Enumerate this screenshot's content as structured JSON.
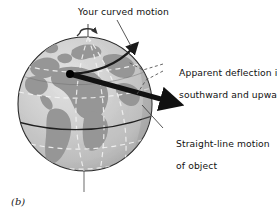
{
  "figure": {
    "caption": "(b)",
    "background_color": "#ffffff",
    "width": 277,
    "height": 220
  },
  "labels": {
    "curved_motion": "Your curved motion",
    "apparent_deflection_line1": "Apparent deflection is",
    "apparent_deflection_line2": "southward and upward",
    "straight_line_line1": "Straight-line motion",
    "straight_line_line2": "of object"
  },
  "globe": {
    "name": "earth-globe",
    "center_x": 85,
    "center_y": 104,
    "radius": 67,
    "ocean_color": "#c9c9c9",
    "land_color": "#969696",
    "outline_color": "#2b2b2b",
    "highlight_color": "#e2e2e2",
    "shadow_color": "#8f8f8f",
    "gridline_color": "#f2f2f2",
    "equator_color": "#1f1f1f",
    "axis_color": "#555555"
  },
  "annotations": {
    "origin_dot": {
      "name": "launch-point-dot",
      "x": 70,
      "y": 74,
      "radius": 4,
      "color": "#000000"
    },
    "straight_arrow": {
      "name": "straight-line-motion-arrow",
      "from_x": 70,
      "from_y": 74,
      "to_x": 174,
      "to_y": 103,
      "color": "#111111",
      "thickness": 5
    },
    "curved_arrow": {
      "name": "curved-motion-arrow",
      "from_x": 70,
      "from_y": 74,
      "to_x": 140,
      "to_y": 44,
      "color": "#1a1a1a",
      "thickness": 2.4
    },
    "rotation_arrow": {
      "name": "earth-rotation-arrow",
      "x": 88,
      "y": 31,
      "color": "#333333"
    },
    "deflection_dashes": {
      "name": "deflection-dashed-lines",
      "color": "#555555"
    },
    "leader_lines": {
      "name": "label-leader-lines",
      "color": "#444444"
    }
  },
  "icons": {
    "rotation": "curved-rotation-arrow-icon",
    "arrowhead": "arrowhead-icon"
  }
}
